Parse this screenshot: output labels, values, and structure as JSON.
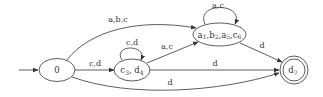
{
  "diagram": {
    "type": "finite-automaton",
    "colors": {
      "stroke": "#333333",
      "background": "#ffffff"
    },
    "start_state": "0",
    "nodes": [
      {
        "id": "q0",
        "label": "0",
        "accepting": false
      },
      {
        "id": "q1",
        "label_parts": [
          {
            "base": "a",
            "sub": "1"
          },
          {
            "sep": ","
          },
          {
            "base": "b",
            "sub": "2"
          },
          {
            "sep": ","
          },
          {
            "base": "a",
            "sub": "5"
          },
          {
            "sep": ","
          },
          {
            "base": "c",
            "sub": "6"
          }
        ],
        "label": "a1,b2,a5,c6",
        "accepting": false
      },
      {
        "id": "q2",
        "label_parts": [
          {
            "base": "c",
            "sub": "3"
          },
          {
            "sep": ", "
          },
          {
            "base": "d",
            "sub": "4"
          }
        ],
        "label": "c3,d4",
        "accepting": false
      },
      {
        "id": "q3",
        "label_parts": [
          {
            "base": "d",
            "sub": "7"
          }
        ],
        "label": "d7",
        "accepting": true
      }
    ],
    "edges": [
      {
        "from": "q0",
        "to": "q1",
        "label": "a,b,c"
      },
      {
        "from": "q0",
        "to": "q2",
        "label": "c,d"
      },
      {
        "from": "q0",
        "to": "q3",
        "label": "d"
      },
      {
        "from": "q2",
        "to": "q2",
        "label": "c,d"
      },
      {
        "from": "q2",
        "to": "q1",
        "label": "a,c"
      },
      {
        "from": "q2",
        "to": "q3",
        "label": "d"
      },
      {
        "from": "q1",
        "to": "q1",
        "label": "a,c"
      },
      {
        "from": "q1",
        "to": "q3",
        "label": "d"
      }
    ]
  }
}
